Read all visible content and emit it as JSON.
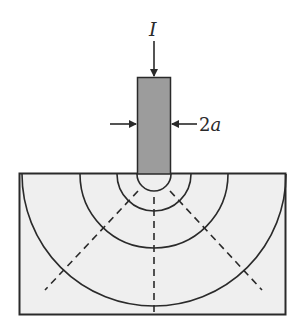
{
  "diagram": {
    "current_label": "I",
    "width_label": "2a",
    "colors": {
      "line": "#2a2a2a",
      "electrode_fill": "#9c9c9c",
      "medium_fill": "#efefef",
      "background": "#ffffff"
    },
    "electrode": {
      "x": 137,
      "y": 77,
      "width": 34,
      "tip_radius": 17
    },
    "medium": {
      "x": 19,
      "y": 173,
      "width": 266,
      "height": 141
    },
    "equipotential_radii": [
      17,
      37,
      74,
      132
    ],
    "current_lines": [
      "left-diagonal",
      "vertical",
      "right-diagonal"
    ]
  }
}
